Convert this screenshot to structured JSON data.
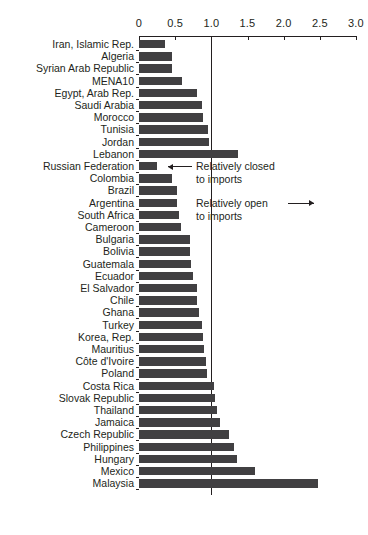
{
  "chart_data": {
    "type": "bar",
    "orientation": "horizontal",
    "title": "",
    "subtitle": "",
    "xlabel": "",
    "ylabel": "",
    "xlim": [
      0,
      3.0
    ],
    "xticks": [
      0,
      0.5,
      1.0,
      1.5,
      2.0,
      2.5,
      3.0
    ],
    "xtick_labels": [
      "0",
      "0.5",
      "1.0",
      "1.5",
      "2.0",
      "2.5",
      "3.0"
    ],
    "grid": false,
    "legend": null,
    "reference_line": {
      "value": 1.0,
      "label": ""
    },
    "bar_color": "#414042",
    "axis_color": "#231f20",
    "categories": [
      "Iran, Islamic Rep.",
      "Algeria",
      "Syrian Arab Republic",
      "MENA10",
      "Egypt, Arab Rep.",
      "Saudi Arabia",
      "Morocco",
      "Tunisia",
      "Jordan",
      "Lebanon",
      "Russian Federation",
      "Colombia",
      "Brazil",
      "Argentina",
      "South Africa",
      "Cameroon",
      "Bulgaria",
      "Bolivia",
      "Guatemala",
      "Ecuador",
      "El Salvador",
      "Chile",
      "Ghana",
      "Turkey",
      "Korea, Rep.",
      "Mauritius",
      "Côte d'Ivoire",
      "Poland",
      "Costa Rica",
      "Slovak Republic",
      "Thailand",
      "Jamaica",
      "Czech Republic",
      "Philippines",
      "Hungary",
      "Mexico",
      "Malaysia"
    ],
    "values": [
      0.36,
      0.46,
      0.46,
      0.6,
      0.8,
      0.87,
      0.88,
      0.95,
      0.97,
      1.37,
      0.25,
      0.46,
      0.52,
      0.53,
      0.55,
      0.58,
      0.7,
      0.7,
      0.72,
      0.74,
      0.8,
      0.8,
      0.83,
      0.87,
      0.89,
      0.9,
      0.92,
      0.94,
      1.03,
      1.05,
      1.08,
      1.12,
      1.25,
      1.32,
      1.35,
      1.61,
      2.47
    ],
    "annotations": [
      {
        "name": "relatively-closed-annotation",
        "text_line1": "Relatively closed",
        "text_line2": "to imports",
        "arrow": "left"
      },
      {
        "name": "relatively-open-annotation",
        "text_line1": "Relatively open",
        "text_line2": "to imports",
        "arrow": "right"
      }
    ]
  }
}
